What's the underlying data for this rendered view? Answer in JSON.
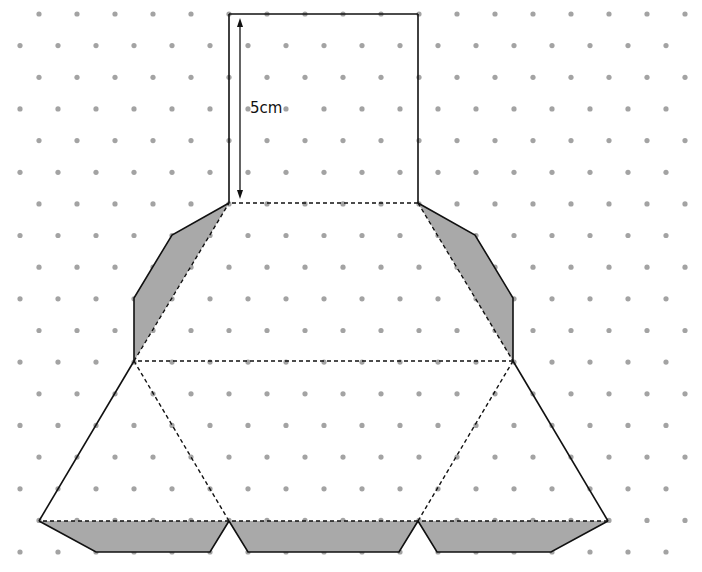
{
  "diagram": {
    "colors": {
      "background": "#ffffff",
      "dot": "#a3a3a3",
      "line": "#111111",
      "flap_fill": "#a9a9a9"
    },
    "grid": {
      "origin_y": 14,
      "row_spacing": 31.65,
      "col_spacing": 38,
      "odd_row_x0": 39,
      "even_row_x0": 20,
      "rows": 18,
      "x_max": 690,
      "dot_radius": 2.6
    },
    "dimension": {
      "label": "5cm",
      "label_x": 250,
      "label_y": 113,
      "arrow_x": 240,
      "arrow_y1": 18,
      "arrow_y2": 199
    },
    "faces": [
      {
        "name": "top-square",
        "points": [
          [
            229,
            14
          ],
          [
            418,
            14
          ],
          [
            418,
            203
          ],
          [
            229,
            203
          ]
        ],
        "solid_edges": [
          [
            0,
            1
          ],
          [
            1,
            2
          ],
          [
            3,
            0
          ]
        ],
        "dashed_edges": [
          [
            2,
            3
          ]
        ]
      },
      {
        "name": "middle-trapezoid",
        "points": [
          [
            229,
            203
          ],
          [
            418,
            203
          ],
          [
            513,
            361
          ],
          [
            134,
            361
          ]
        ],
        "solid_edges": [],
        "dashed_edges": [
          [
            0,
            1
          ],
          [
            1,
            2
          ],
          [
            2,
            3
          ],
          [
            3,
            0
          ]
        ]
      },
      {
        "name": "bottom-left-triangle",
        "points": [
          [
            134,
            361
          ],
          [
            229,
            521
          ],
          [
            39,
            521
          ]
        ],
        "solid_edges": [
          [
            2,
            0
          ]
        ],
        "dashed_edges": [
          [
            0,
            1
          ],
          [
            1,
            2
          ]
        ]
      },
      {
        "name": "bottom-middle-triangle",
        "points": [
          [
            134,
            361
          ],
          [
            513,
            361
          ],
          [
            418,
            521
          ],
          [
            229,
            521
          ]
        ],
        "solid_edges": [],
        "dashed_edges": [
          [
            1,
            2
          ],
          [
            2,
            3
          ]
        ]
      },
      {
        "name": "bottom-right-triangle",
        "points": [
          [
            513,
            361
          ],
          [
            608,
            521
          ],
          [
            418,
            521
          ]
        ],
        "solid_edges": [
          [
            0,
            1
          ]
        ],
        "dashed_edges": [
          [
            2,
            0
          ],
          [
            1,
            2
          ]
        ]
      }
    ],
    "flaps": [
      {
        "name": "left-side-flap",
        "points": [
          [
            229,
            203
          ],
          [
            172,
            235
          ],
          [
            134,
            298
          ],
          [
            134,
            361
          ]
        ]
      },
      {
        "name": "right-side-flap",
        "points": [
          [
            418,
            203
          ],
          [
            475,
            235
          ],
          [
            513,
            298
          ],
          [
            513,
            361
          ]
        ]
      },
      {
        "name": "bottom-left-flap",
        "points": [
          [
            39,
            521
          ],
          [
            96,
            552
          ],
          [
            210,
            552
          ],
          [
            229,
            521
          ]
        ]
      },
      {
        "name": "bottom-middle-flap",
        "points": [
          [
            229,
            521
          ],
          [
            248,
            552
          ],
          [
            399,
            552
          ],
          [
            418,
            521
          ]
        ]
      },
      {
        "name": "bottom-right-flap",
        "points": [
          [
            418,
            521
          ],
          [
            437,
            552
          ],
          [
            551,
            552
          ],
          [
            608,
            521
          ]
        ]
      }
    ]
  }
}
